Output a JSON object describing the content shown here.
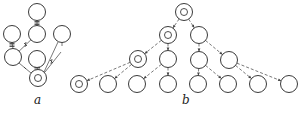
{
  "figure": {
    "panels": [
      {
        "id": "a",
        "label": "a",
        "label_pos": [
          37,
          104
        ],
        "nodes": [
          {
            "id": "a1",
            "x": 37,
            "y": 12,
            "double": false
          },
          {
            "id": "a2",
            "x": 12,
            "y": 34,
            "double": false
          },
          {
            "id": "a3",
            "x": 37,
            "y": 34,
            "double": false
          },
          {
            "id": "a4",
            "x": 62,
            "y": 34,
            "double": false
          },
          {
            "id": "a5",
            "x": 13,
            "y": 57,
            "double": false
          },
          {
            "id": "a6",
            "x": 37,
            "y": 59,
            "double": false
          },
          {
            "id": "a7",
            "x": 38,
            "y": 78,
            "double": true
          }
        ],
        "edges": [
          {
            "from": "a1",
            "to": "a3",
            "style": "solid",
            "mark": "ticks"
          },
          {
            "from": "a2",
            "to": "a5",
            "style": "solid",
            "mark": "ticks"
          },
          {
            "from": "a3",
            "to": "a5",
            "style": "solid",
            "mark": "cross"
          },
          {
            "from": "a5",
            "to": "a7",
            "style": "solid",
            "mark": "arrow"
          },
          {
            "from": "a6",
            "to": "a7",
            "style": "solid",
            "mark": "ticks"
          },
          {
            "from": "a4",
            "to": "a7",
            "style": "solid",
            "mark": "cross"
          },
          {
            "from": "a4",
            "to": "a4b",
            "style": "solid",
            "mark": "ticks"
          }
        ]
      },
      {
        "id": "b",
        "label": "b",
        "label_pos": [
          185,
          104
        ],
        "nodes": [
          {
            "id": "b1",
            "x": 184,
            "y": 12,
            "double": true
          },
          {
            "id": "b2",
            "x": 168,
            "y": 35,
            "double": true
          },
          {
            "id": "b3",
            "x": 199,
            "y": 35,
            "double": false
          },
          {
            "id": "b4",
            "x": 138,
            "y": 59,
            "double": true
          },
          {
            "id": "b5",
            "x": 168,
            "y": 59,
            "double": false
          },
          {
            "id": "b6",
            "x": 199,
            "y": 60,
            "double": false
          },
          {
            "id": "b7",
            "x": 229,
            "y": 60,
            "double": false
          },
          {
            "id": "b8",
            "x": 79,
            "y": 84,
            "double": true
          },
          {
            "id": "b9",
            "x": 108,
            "y": 84,
            "double": false
          },
          {
            "id": "b10",
            "x": 137,
            "y": 84,
            "double": false
          },
          {
            "id": "b11",
            "x": 168,
            "y": 84,
            "double": false
          },
          {
            "id": "b12",
            "x": 198,
            "y": 84,
            "double": false
          },
          {
            "id": "b13",
            "x": 228,
            "y": 84,
            "double": false
          },
          {
            "id": "b14",
            "x": 258,
            "y": 84,
            "double": false
          },
          {
            "id": "b15",
            "x": 289,
            "y": 84,
            "double": false
          }
        ],
        "edges": [
          {
            "from": "b1",
            "to": "b2",
            "style": "dashed"
          },
          {
            "from": "b1",
            "to": "b3",
            "style": "dashed"
          },
          {
            "from": "b2",
            "to": "b4",
            "style": "dashed"
          },
          {
            "from": "b2",
            "to": "b5",
            "style": "dashed"
          },
          {
            "from": "b3",
            "to": "b6",
            "style": "dashed"
          },
          {
            "from": "b3",
            "to": "b7",
            "style": "dashed"
          },
          {
            "from": "b4",
            "to": "b8",
            "style": "dashed"
          },
          {
            "from": "b4",
            "to": "b9",
            "style": "dashed"
          },
          {
            "from": "b5",
            "to": "b10",
            "style": "dashed"
          },
          {
            "from": "b5",
            "to": "b11",
            "style": "dashed"
          },
          {
            "from": "b6",
            "to": "b12",
            "style": "dashed"
          },
          {
            "from": "b6",
            "to": "b13",
            "style": "dashed"
          },
          {
            "from": "b7",
            "to": "b14",
            "style": "dashed"
          },
          {
            "from": "b7",
            "to": "b15",
            "style": "dashed"
          }
        ]
      }
    ],
    "node_radius": 8.5,
    "inner_radius": 3.5
  }
}
